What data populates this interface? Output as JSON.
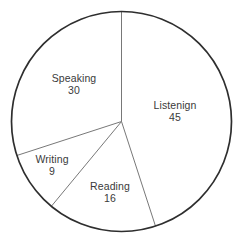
{
  "chart_data": {
    "type": "pie",
    "title": "",
    "subtitle": "",
    "xlabel": "",
    "ylabel": "",
    "grid": false,
    "legend": "none",
    "start_angle_deg": 0,
    "direction": "clockwise",
    "total": 100,
    "categories": [
      "Listenign",
      "Reading",
      "Writing",
      "Speaking"
    ],
    "values": [
      45,
      16,
      9,
      30
    ],
    "slices": [
      {
        "label": "Listenign",
        "value": "45",
        "value_num": 45,
        "percent": 45,
        "start_deg": 0,
        "end_deg": 162,
        "label_x": 175,
        "label_y": 111
      },
      {
        "label": "Reading",
        "value": "16",
        "value_num": 16,
        "percent": 16,
        "start_deg": 162,
        "end_deg": 219.6,
        "label_x": 110,
        "label_y": 192
      },
      {
        "label": "Writing",
        "value": "9",
        "value_num": 9,
        "percent": 9,
        "start_deg": 219.6,
        "end_deg": 252,
        "label_x": 52,
        "label_y": 165
      },
      {
        "label": "Speaking",
        "value": "30",
        "value_num": 30,
        "percent": 30,
        "start_deg": 252,
        "end_deg": 360,
        "label_x": 74,
        "label_y": 84
      }
    ]
  },
  "geometry": {
    "center_x": 121.5,
    "center_y": 121.5,
    "radius": 110
  },
  "colors": {
    "background": "#ffffff",
    "slice_fill": "#ffffff",
    "outline": "#2e2e2e",
    "divider": "#787878",
    "text": "#3a3a3a"
  }
}
